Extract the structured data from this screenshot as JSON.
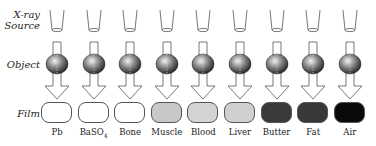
{
  "row_labels": {
    "source_line1": "X-ray",
    "source_line2": "Source",
    "object": "Object",
    "film": "Film"
  },
  "materials": [
    {
      "label": "Pb",
      "film_color": "#ffffff"
    },
    {
      "label": "BaSO",
      "sub": "4",
      "film_color": "#ffffff"
    },
    {
      "label": "Bone",
      "film_color": "#ffffff"
    },
    {
      "label": "Muscle",
      "film_color": "#c8c8c8"
    },
    {
      "label": "Blood",
      "film_color": "#d4d4d4"
    },
    {
      "label": "Liver",
      "film_color": "#d0d0d0"
    },
    {
      "label": "Butter",
      "film_color": "#3a3a3a"
    },
    {
      "label": "Fat",
      "film_color": "#383838"
    },
    {
      "label": "Air",
      "film_color": "#0a0a0a"
    }
  ]
}
